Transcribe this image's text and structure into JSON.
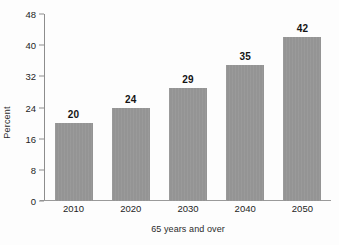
{
  "chart_data": {
    "type": "bar",
    "title": "",
    "subtitle": "",
    "xlabel": "65 years and over",
    "ylabel": "Percent",
    "categories": [
      "2010",
      "2020",
      "2030",
      "2040",
      "2050"
    ],
    "values": [
      20,
      24,
      29,
      35,
      42
    ],
    "data_labels": [
      "20",
      "24",
      "29",
      "35",
      "42"
    ],
    "ylim": [
      0,
      48
    ],
    "yticks": [
      0,
      8,
      16,
      24,
      32,
      40,
      48
    ],
    "ytick_labels": [
      "0",
      "8",
      "16",
      "24",
      "32",
      "40",
      "48"
    ],
    "grid": false,
    "legend": false,
    "legend_position": "none",
    "series": [
      {
        "name": "Percent 65 years and over",
        "values": [
          20,
          24,
          29,
          35,
          42
        ],
        "color": "#949494"
      }
    ],
    "colors": {
      "bar_fill": "#949494",
      "axis_line": "#8d8d8d",
      "text": "#1e1e1e",
      "background": "#fdfdfd"
    }
  }
}
